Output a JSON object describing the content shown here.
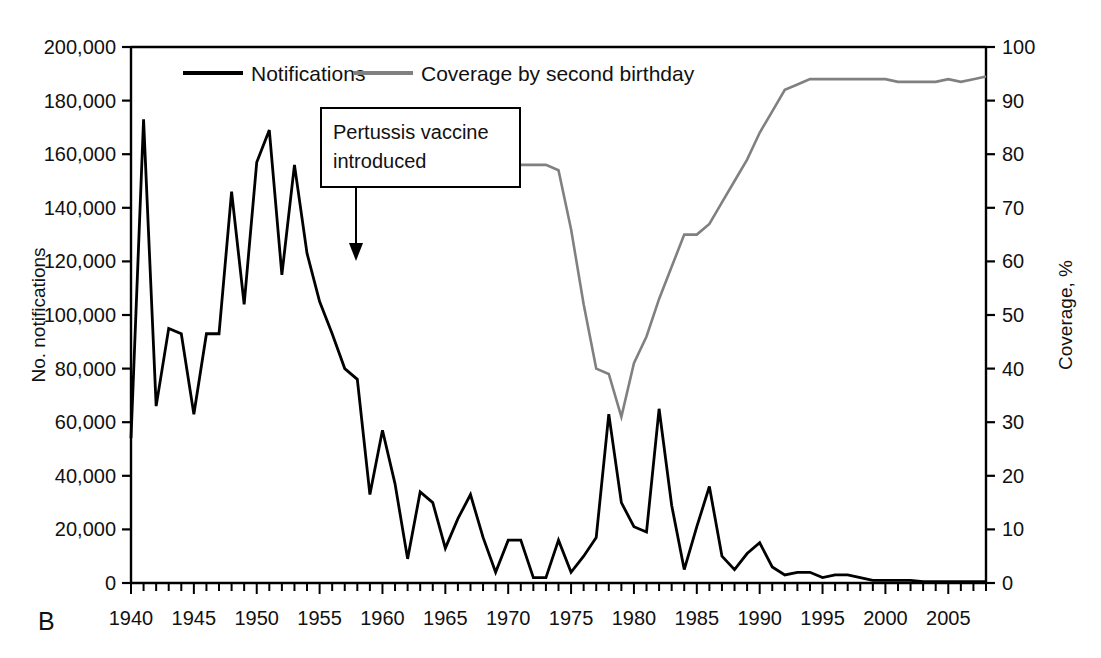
{
  "panel": {
    "label": "B"
  },
  "legend": {
    "position": "top-center",
    "entries": [
      {
        "label": "Notifications",
        "color": "#000000",
        "axis": "left"
      },
      {
        "label": "Coverage by second birthday",
        "color": "#808080",
        "axis": "right"
      }
    ]
  },
  "annotation": {
    "line1": "Pertussis vaccine",
    "line2": "introduced",
    "points_to_year": 1957
  },
  "axes": {
    "left": {
      "title": "No. notifications",
      "ticks": [
        "0",
        "20,000",
        "40,000",
        "60,000",
        "80,000",
        "100,000",
        "120,000",
        "140,000",
        "160,000",
        "180,000",
        "200,000"
      ],
      "min": 0,
      "max": 200000,
      "step": 20000
    },
    "right": {
      "title": "Coverage, %",
      "ticks": [
        "0",
        "10",
        "20",
        "30",
        "40",
        "50",
        "60",
        "70",
        "80",
        "90",
        "100"
      ],
      "min": 0,
      "max": 100,
      "step": 10
    },
    "bottom": {
      "ticks": [
        "1940",
        "1945",
        "1950",
        "1955",
        "1960",
        "1965",
        "1970",
        "1975",
        "1980",
        "1985",
        "1990",
        "1995",
        "2000",
        "2005"
      ],
      "min": 1940,
      "max": 2008,
      "minor_step": 1,
      "major_step": 5
    }
  },
  "chart_data": {
    "type": "line",
    "title": "",
    "subtitle": "",
    "xlabel": "",
    "ylabel": "No. notifications",
    "y2label": "Coverage, %",
    "xlim": [
      1940,
      2008
    ],
    "ylim": [
      0,
      200000
    ],
    "y2lim": [
      0,
      100
    ],
    "grid": false,
    "legend_position": "top-center",
    "annotations": [
      {
        "text": "Pertussis vaccine introduced",
        "x": 1957,
        "type": "arrow-box"
      }
    ],
    "series": [
      {
        "name": "Notifications",
        "color": "#000000",
        "axis": "left",
        "x": [
          1940,
          1941,
          1942,
          1943,
          1944,
          1945,
          1946,
          1947,
          1948,
          1949,
          1950,
          1951,
          1952,
          1953,
          1954,
          1955,
          1956,
          1957,
          1958,
          1959,
          1960,
          1961,
          1962,
          1963,
          1964,
          1965,
          1966,
          1967,
          1968,
          1969,
          1970,
          1971,
          1972,
          1973,
          1974,
          1975,
          1976,
          1977,
          1978,
          1979,
          1980,
          1981,
          1982,
          1983,
          1984,
          1985,
          1986,
          1987,
          1988,
          1989,
          1990,
          1991,
          1992,
          1993,
          1994,
          1995,
          1996,
          1997,
          1998,
          1999,
          2000,
          2001,
          2002,
          2003,
          2004,
          2005,
          2006,
          2007,
          2008
        ],
        "y": [
          54000,
          173000,
          66000,
          95000,
          93000,
          63000,
          93000,
          93000,
          146000,
          104000,
          157000,
          169000,
          115000,
          156000,
          123000,
          105000,
          93000,
          80000,
          76000,
          33000,
          57000,
          37000,
          9000,
          34000,
          30000,
          13000,
          24000,
          33000,
          17000,
          4000,
          16000,
          16000,
          2000,
          2000,
          16000,
          4000,
          10000,
          17000,
          63000,
          30000,
          21000,
          19000,
          65000,
          29000,
          5000,
          21000,
          36000,
          10000,
          5000,
          11000,
          15000,
          6000,
          3000,
          4000,
          4000,
          2000,
          3000,
          3000,
          2000,
          1000,
          1000,
          1000,
          1000,
          500,
          500,
          500,
          500,
          500,
          500
        ]
      },
      {
        "name": "Coverage by second birthday",
        "color": "#808080",
        "axis": "right",
        "x": [
          1970,
          1971,
          1972,
          1973,
          1974,
          1975,
          1976,
          1977,
          1978,
          1979,
          1980,
          1981,
          1982,
          1983,
          1984,
          1985,
          1986,
          1987,
          1988,
          1989,
          1990,
          1991,
          1992,
          1993,
          1994,
          1995,
          1996,
          1997,
          1998,
          1999,
          2000,
          2001,
          2002,
          2003,
          2004,
          2005,
          2006,
          2007,
          2008
        ],
        "y": [
          78,
          78,
          78,
          78,
          77,
          66,
          52,
          40,
          39,
          31,
          41,
          46,
          53,
          59,
          65,
          65,
          67,
          71,
          75,
          79,
          84,
          88,
          92,
          93,
          94,
          94,
          94,
          94,
          94,
          94,
          94,
          93.5,
          93.5,
          93.5,
          93.5,
          94,
          93.5,
          94,
          94.5
        ]
      }
    ]
  }
}
